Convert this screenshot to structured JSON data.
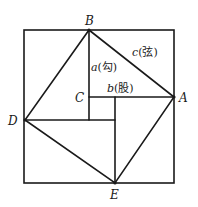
{
  "diagram": {
    "title": "",
    "points": {
      "A": {
        "label": "A",
        "x": 174,
        "y": 97
      },
      "B": {
        "label": "B",
        "x": 89,
        "y": 30
      },
      "C": {
        "label": "C",
        "x": 89,
        "y": 97
      },
      "D": {
        "label": "D",
        "x": 25,
        "y": 120
      },
      "E": {
        "label": "E",
        "x": 115,
        "y": 183
      }
    },
    "sides": {
      "a": {
        "var": "a",
        "name": "(勾)"
      },
      "b": {
        "var": "b",
        "name": "(股)"
      },
      "c": {
        "var": "c",
        "name": "(弦)"
      }
    },
    "outer_square": {
      "x": 24,
      "y": 30,
      "w": 150,
      "h": 153
    },
    "colors": {
      "stroke": "#1a1a1a",
      "background": "#ffffff"
    }
  }
}
